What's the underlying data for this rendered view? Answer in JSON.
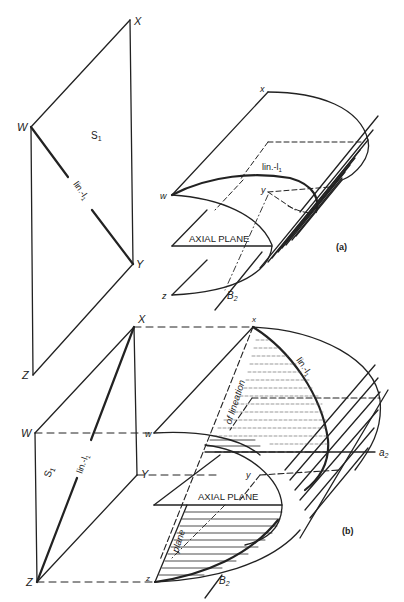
{
  "figure": {
    "panel_a": {
      "caption": "(a)",
      "plane_label": "S",
      "plane_sub": "1",
      "lineation_label": "lin.-l",
      "lineation_sub": "1",
      "vertices_upper": {
        "X": "X",
        "W": "W",
        "Y": "Y",
        "Z": "Z"
      },
      "vertices_lower": {
        "x": "x",
        "w": "w",
        "y": "y",
        "z": "z"
      },
      "axial_plane_label": "AXIAL PLANE",
      "fold_axis_label": "B",
      "fold_axis_sub": "2"
    },
    "panel_b": {
      "caption": "(b)",
      "plane_label": "S",
      "plane_sub": "1",
      "lineation_label": "lin.-l",
      "lineation_sub": "1",
      "vertices_upper": {
        "X": "X",
        "W": "W",
        "Y": "Y",
        "Z": "Z"
      },
      "vertices_lower": {
        "x": "x",
        "w": "w",
        "y": "y",
        "z": "z"
      },
      "axial_plane_label": "AXIAL PLANE",
      "fold_axis_label": "B",
      "fold_axis_sub": "2",
      "a_axis_label": "a",
      "a_axis_sub": "2",
      "plane_of_lineation_upper": "of lineation",
      "plane_of_lineation_lower": "plane"
    },
    "colors": {
      "ink": "#222222",
      "background": "#ffffff"
    }
  }
}
